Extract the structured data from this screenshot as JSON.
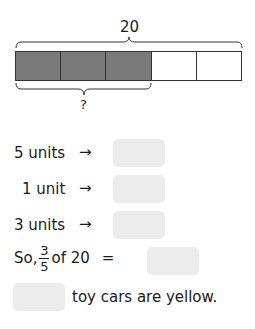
{
  "model": {
    "total_label": "20",
    "unknown_label": "?",
    "units_total": 5,
    "units_shaded": 3,
    "shaded_color": "#7a7a7a"
  },
  "rows": [
    {
      "label": "5 units",
      "arrow": "→"
    },
    {
      "label": "1 unit",
      "arrow": "→"
    },
    {
      "label": "3 units",
      "arrow": "→"
    }
  ],
  "conclusion": {
    "prefix": "So,",
    "numerator": "3",
    "denominator": "5",
    "suffix": "of 20",
    "equals": "="
  },
  "final_sentence": {
    "text": "toy cars are yellow."
  }
}
